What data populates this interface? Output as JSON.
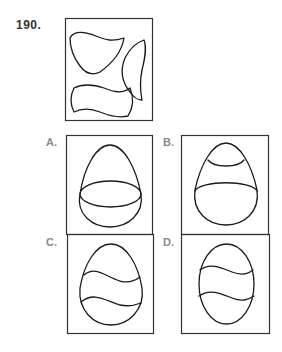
{
  "question": {
    "number": "190.",
    "prompt_figure": "Three cut-out curved pieces: an egg-top cap piece, a narrow crescent sliver, and a wavy band piece"
  },
  "options": [
    {
      "label": "A.",
      "description": "Egg with a horizontal elliptical band at the middle"
    },
    {
      "label": "B.",
      "description": "Egg with a small cap at the top and an elliptical band below the middle"
    },
    {
      "label": "C.",
      "description": "Egg with two wavy lines across the middle"
    },
    {
      "label": "D.",
      "description": "Narrower oval egg with two wavy lines across the middle"
    }
  ],
  "colors": {
    "ink": "#1a1a1a",
    "label_gray": "#8a8a8a",
    "number_dark": "#333333"
  }
}
